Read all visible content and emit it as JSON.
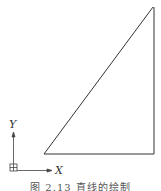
{
  "figure": {
    "caption": "图 2.13   直线的绘制",
    "line_color": "#333333"
  },
  "triangle": {
    "vertices": [
      {
        "name": "top",
        "x": 153,
        "y": 7
      },
      {
        "name": "bottom-left",
        "x": 44,
        "y": 154
      },
      {
        "name": "bottom-right",
        "x": 154,
        "y": 154
      }
    ]
  },
  "ucs_icon": {
    "x_label": "X",
    "y_label": "Y"
  }
}
